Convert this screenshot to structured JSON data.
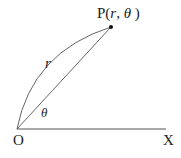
{
  "diagram": {
    "type": "polar-coordinates",
    "point_label": "P",
    "point_coords_open": "(",
    "point_r": "r",
    "point_sep": ",",
    "point_theta": "θ",
    "point_coords_close": ")",
    "radius_label": "r",
    "angle_label": "θ",
    "origin_label": "O",
    "axis_label": "X",
    "colors": {
      "line": "#555555",
      "text": "#222222",
      "point": "#111111"
    }
  }
}
